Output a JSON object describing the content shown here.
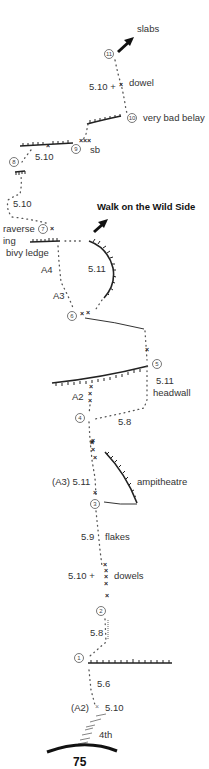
{
  "page": {
    "page_number": "75",
    "route_name": "Walk on the Wild Side"
  },
  "belays": [
    {
      "num": "1",
      "x": 79,
      "y": 658
    },
    {
      "num": "2",
      "x": 101,
      "y": 611
    },
    {
      "num": "3",
      "x": 95,
      "y": 504
    },
    {
      "num": "4",
      "x": 80,
      "y": 418
    },
    {
      "num": "5",
      "x": 157,
      "y": 364
    },
    {
      "num": "6",
      "x": 72,
      "y": 316
    },
    {
      "num": "7",
      "x": 43,
      "y": 229
    },
    {
      "num": "8",
      "x": 14,
      "y": 162
    },
    {
      "num": "9",
      "x": 76,
      "y": 149
    },
    {
      "num": "10",
      "x": 132,
      "y": 118
    },
    {
      "num": "11",
      "x": 109,
      "y": 54
    }
  ],
  "labels": {
    "slabs": "slabs",
    "p11_grade": "5.10 +",
    "dowel": "dowel",
    "very_bad_belay": "very bad belay",
    "p9_grade": "5.10",
    "sb": "sb",
    "p8_grade": "5.10",
    "traverse": "raverse",
    "ing": "ing",
    "bivy_ledge": "bivy ledge",
    "walk_wild_side": "Walk on the Wild Side",
    "a4": "A4",
    "p6_grade_right": "5.11",
    "a3": "A3",
    "a2": "A2",
    "p5_grade": "5.11",
    "headwall": "headwall",
    "p4_grade": "5.8",
    "p3_grade": "(A3) 5.11",
    "ampitheatre": "ampitheatre",
    "p2b_grade": "5.9",
    "flakes": "flakes",
    "p2_grade": "5.10 +",
    "dowels": "dowels",
    "p1b_grade": "5.8",
    "p1_grade": "5.6",
    "start_aid": "(A2)",
    "start_grade": "5.10",
    "fourth": "4th"
  },
  "colors": {
    "ink": "#222222",
    "text": "#333333",
    "background": "#ffffff"
  }
}
